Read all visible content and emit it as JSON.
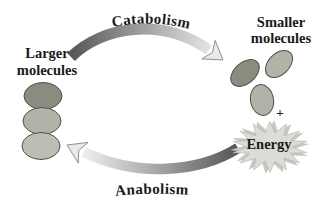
{
  "diagram": {
    "labels": {
      "top_arrow": "Catabolism",
      "bottom_arrow": "Anabolism",
      "left_molecules_line1": "Larger",
      "left_molecules_line2": "molecules",
      "right_molecules_line1": "Smaller",
      "right_molecules_line2": "molecules",
      "energy": "Energy",
      "plus": "+"
    },
    "molecules": {
      "left_count": 3,
      "right_count": 3
    },
    "colors": {
      "molecule_dark": "#8b8b7f",
      "molecule_medium": "#b2b2a8",
      "molecule_light": "#bdbdb3",
      "arrow_dark": "#565656",
      "arrow_light": "#ececec",
      "arrowhead_fill": "#e9e9e9",
      "burst_fill": "#dcdcd6",
      "burst_back_fill": "#c8c8c2",
      "text": "#1a1a1a"
    }
  }
}
